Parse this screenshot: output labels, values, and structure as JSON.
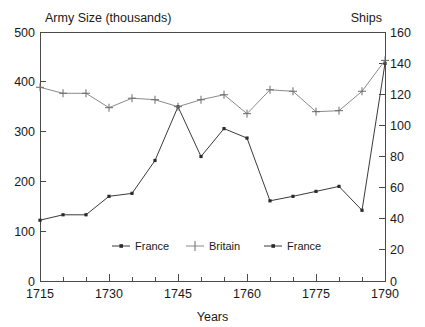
{
  "chart_data": {
    "type": "line",
    "title": "",
    "ylabel": "Army Size (thousands)",
    "y2label": "Ships",
    "xlabel": "Years",
    "xlim": [
      1715,
      1790
    ],
    "ylim": [
      0,
      500
    ],
    "y2lim": [
      0,
      160
    ],
    "grid": false,
    "legend_position": "inside-bottom-center",
    "x_tick_labels": [
      "1715",
      "1730",
      "1745",
      "1760",
      "1775",
      "1790"
    ],
    "x_tick_values": [
      1715,
      1730,
      1745,
      1760,
      1775,
      1790
    ],
    "x_minor_tick_values": [
      1720,
      1725,
      1735,
      1740,
      1750,
      1755,
      1765,
      1770,
      1780,
      1785
    ],
    "y_tick_labels": [
      "0",
      "100",
      "200",
      "300",
      "400",
      "500"
    ],
    "y_tick_values": [
      0,
      100,
      200,
      300,
      400,
      500
    ],
    "y2_tick_labels": [
      "0",
      "20",
      "40",
      "60",
      "80",
      "100",
      "120",
      "140",
      "160"
    ],
    "y2_tick_values": [
      0,
      20,
      40,
      60,
      80,
      100,
      120,
      140,
      160
    ],
    "series": [
      {
        "name": "France",
        "axis": "left",
        "marker": "square",
        "x": [
          1715,
          1720,
          1725,
          1730,
          1735,
          1740,
          1745,
          1750,
          1755,
          1760,
          1765,
          1770,
          1775,
          1780,
          1785,
          1790
        ],
        "values": [
          122,
          133,
          133,
          170,
          176,
          242,
          350,
          250,
          306,
          287,
          161,
          170,
          180,
          190,
          142,
          437
        ]
      },
      {
        "name": "Britain",
        "axis": "left",
        "marker": "plus",
        "x": [
          1715,
          1720,
          1725,
          1730,
          1735,
          1740,
          1745,
          1750,
          1755,
          1760,
          1765,
          1770,
          1775,
          1780,
          1785,
          1790
        ],
        "values": [
          389,
          377,
          377,
          348,
          367,
          364,
          350,
          364,
          374,
          336,
          384,
          381,
          340,
          342,
          381,
          443
        ]
      },
      {
        "name": "France",
        "axis": "right",
        "marker": "square",
        "x": [],
        "values": []
      }
    ],
    "legend_entries": [
      {
        "label": "France",
        "marker": "square"
      },
      {
        "label": "Britain",
        "marker": "plus"
      },
      {
        "label": "France",
        "marker": "square"
      }
    ]
  }
}
